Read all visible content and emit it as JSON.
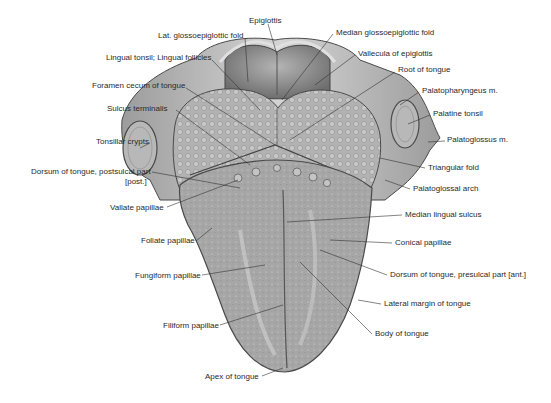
{
  "figure": {
    "colors": {
      "background": "#ffffff",
      "tissue_light": "#c9c9c9",
      "tissue_mid": "#a9a9a9",
      "tissue_dark": "#7a7a7a",
      "outline": "#4a4a4a",
      "leader_line": "#333333",
      "label_text": "#2a2a2a"
    },
    "labels_left": [
      {
        "id": "lat-glossoepiglottic-fold",
        "text": "Lat. glossoepiglottic fold",
        "x": 158,
        "y": 35
      },
      {
        "id": "lingual-tonsil",
        "text": "Lingual tonsil; Lingual follicles",
        "x": 106,
        "y": 57
      },
      {
        "id": "foramen-cecum",
        "text": "Foramen cecum of tongue",
        "x": 92,
        "y": 85
      },
      {
        "id": "sulcus-terminalis",
        "text": "Sulcus terminalis",
        "x": 107,
        "y": 107
      },
      {
        "id": "tonsillar-crypts",
        "text": "Tonsillar crypts",
        "x": 96,
        "y": 140
      },
      {
        "id": "dorsum-postsulcal",
        "text": "Dorsum of tongue, postsulcal part",
        "x": 31,
        "y": 170
      },
      {
        "id": "dorsum-postsulcal-post",
        "text": "[post.]",
        "x": 125,
        "y": 180
      },
      {
        "id": "vallate-papillae",
        "text": "Vallate papillae",
        "x": 110,
        "y": 205
      },
      {
        "id": "foliate-papillae",
        "text": "Foliate papillae",
        "x": 141,
        "y": 238
      },
      {
        "id": "fungiform-papillae",
        "text": "Fungiform papillae",
        "x": 135,
        "y": 273
      },
      {
        "id": "filiform-papillae",
        "text": "Filiform papillae",
        "x": 163,
        "y": 322
      },
      {
        "id": "apex-of-tongue",
        "text": "Apex of tongue",
        "x": 205,
        "y": 374
      }
    ],
    "labels_right": [
      {
        "id": "epiglottis",
        "text": "Epiglottis",
        "x": 249,
        "y": 20
      },
      {
        "id": "median-glossoepiglottic-fold",
        "text": "Median glossoepiglottic fold",
        "x": 336,
        "y": 31
      },
      {
        "id": "vallecula-of-epiglottis",
        "text": "Vallecula of epiglottis",
        "x": 358,
        "y": 52
      },
      {
        "id": "root-of-tongue",
        "text": "Root of tongue",
        "x": 398,
        "y": 68
      },
      {
        "id": "palatopharyngeus-m",
        "text": "Palatopharyngeus m.",
        "x": 422,
        "y": 89
      },
      {
        "id": "palatine-tonsil",
        "text": "Palatine tonsil",
        "x": 433,
        "y": 112
      },
      {
        "id": "palatoglossus-m",
        "text": "Palatoglossus m.",
        "x": 447,
        "y": 138
      },
      {
        "id": "triangular-fold",
        "text": "Triangular fold",
        "x": 428,
        "y": 165
      },
      {
        "id": "palatoglossal-arch",
        "text": "Palatoglossal arch",
        "x": 413,
        "y": 186
      },
      {
        "id": "median-lingual-sulcus",
        "text": "Median lingual sulcus",
        "x": 405,
        "y": 212
      },
      {
        "id": "conical-papillae",
        "text": "Conical papillae",
        "x": 395,
        "y": 240
      },
      {
        "id": "dorsum-presulcal",
        "text": "Dorsum of tongue, presulcal part [ant.]",
        "x": 390,
        "y": 272
      },
      {
        "id": "lateral-margin",
        "text": "Lateral margin of tongue",
        "x": 384,
        "y": 301
      },
      {
        "id": "body-of-tongue",
        "text": "Body of tongue",
        "x": 375,
        "y": 331
      }
    ]
  }
}
